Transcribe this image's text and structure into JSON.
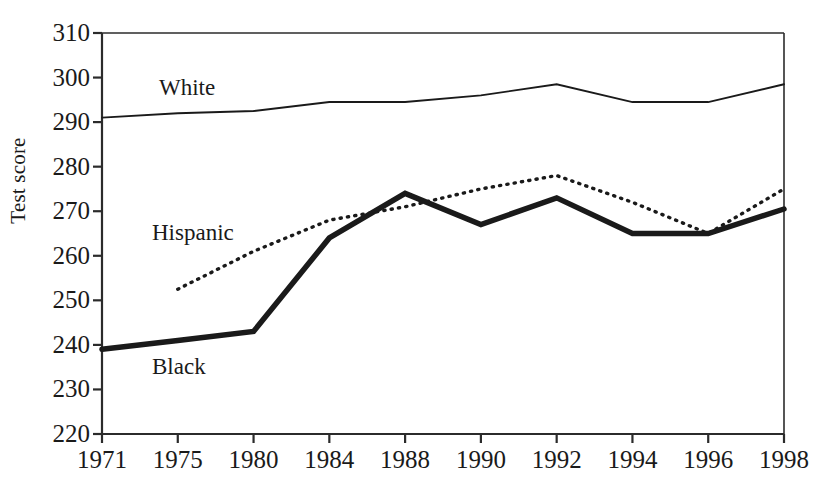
{
  "chart_data": {
    "type": "line",
    "title": "",
    "xlabel": "",
    "ylabel": "Test score",
    "categories": [
      "1971",
      "1975",
      "1980",
      "1984",
      "1988",
      "1990",
      "1992",
      "1994",
      "1996",
      "1998"
    ],
    "ylim": [
      220,
      310
    ],
    "yticks": [
      220,
      230,
      240,
      250,
      260,
      270,
      280,
      290,
      300,
      310
    ],
    "grid": false,
    "legend_position": "inline-annotations",
    "series": [
      {
        "name": "White",
        "style": "thin-solid",
        "color": "#1a1a1a",
        "values": [
          291,
          292,
          292.5,
          294.5,
          294.5,
          296,
          298.5,
          294.5,
          294.5,
          298.5
        ]
      },
      {
        "name": "Hispanic",
        "style": "dotted",
        "color": "#1a1a1a",
        "values": [
          null,
          252.5,
          261,
          268,
          271,
          275,
          278,
          272,
          265,
          275
        ]
      },
      {
        "name": "Black",
        "style": "thick-solid",
        "color": "#1a1a1a",
        "values": [
          239,
          241,
          243,
          264,
          274,
          267,
          273,
          265,
          265,
          270.5
        ]
      }
    ]
  },
  "axes": {
    "y_title": "Test score",
    "y_tick_labels": [
      "310",
      "300",
      "290",
      "280",
      "270",
      "260",
      "250",
      "240",
      "230",
      "220"
    ],
    "x_tick_labels": [
      "1971",
      "1975",
      "1980",
      "1984",
      "1988",
      "1990",
      "1992",
      "1994",
      "1996",
      "1998"
    ]
  },
  "annotations": {
    "white": "White",
    "hispanic": "Hispanic",
    "black": "Black"
  },
  "colors": {
    "ink": "#1a1a1a",
    "axis": "#2b2b2b",
    "background": "#ffffff"
  }
}
